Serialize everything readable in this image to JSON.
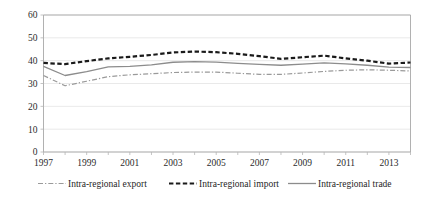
{
  "chart_data": {
    "type": "line",
    "title": "",
    "xlabel": "",
    "ylabel": "",
    "ylim": [
      0,
      60
    ],
    "ytick_step": 10,
    "yticks": [
      "0",
      "10",
      "20",
      "30",
      "40",
      "50",
      "60"
    ],
    "grid": true,
    "legend_position": "bottom",
    "x": [
      1997,
      1998,
      1999,
      2000,
      2001,
      2002,
      2003,
      2004,
      2005,
      2006,
      2007,
      2008,
      2009,
      2010,
      2011,
      2012,
      2013,
      2014
    ],
    "xtick_labels": [
      "1997",
      "1999",
      "2001",
      "2003",
      "2005",
      "2007",
      "2009",
      "2011",
      "2013"
    ],
    "xtick_values": [
      1997,
      1999,
      2001,
      2003,
      2005,
      2007,
      2009,
      2011,
      2013
    ],
    "xlim": [
      1997,
      2014
    ],
    "series": [
      {
        "name": "Intra-regional export",
        "color": "#9a9a9a",
        "style": "dashdot",
        "width": 1.2,
        "values": [
          33.5,
          29.0,
          31.0,
          33.0,
          33.8,
          34.3,
          34.8,
          35.0,
          35.0,
          34.5,
          34.0,
          34.0,
          34.6,
          35.3,
          35.8,
          36.0,
          35.8,
          35.5
        ]
      },
      {
        "name": "Intra-regional import",
        "color": "#1a1a1a",
        "style": "dashed",
        "width": 2.2,
        "values": [
          39.0,
          38.5,
          39.8,
          41.0,
          41.7,
          42.5,
          43.6,
          44.0,
          43.7,
          43.0,
          42.0,
          40.8,
          41.5,
          42.2,
          41.0,
          40.0,
          38.7,
          39.2
        ]
      },
      {
        "name": "Intra-regional trade",
        "color": "#8c8c8c",
        "style": "solid",
        "width": 1.3,
        "values": [
          37.5,
          33.5,
          35.2,
          37.3,
          37.5,
          38.2,
          39.3,
          39.6,
          39.4,
          38.8,
          38.4,
          38.0,
          38.5,
          39.0,
          38.6,
          38.0,
          37.2,
          37.0
        ]
      }
    ]
  },
  "legend": {
    "items": [
      {
        "label": "Intra-regional export"
      },
      {
        "label": "Intra-regional import"
      },
      {
        "label": "Intra-regional trade"
      }
    ]
  }
}
